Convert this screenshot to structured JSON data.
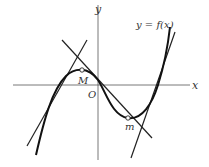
{
  "diagram": {
    "title": "",
    "curve_label": "y = f(x)",
    "axis_labels": {
      "x": "x",
      "y": "y",
      "origin": "O"
    },
    "points": [
      {
        "name": "M",
        "label": "M",
        "kind": "local maximum",
        "px": [
          82,
          70
        ]
      },
      {
        "name": "m",
        "label": "m",
        "kind": "local minimum",
        "px": [
          128,
          118
        ]
      }
    ],
    "lines": [
      {
        "name": "line-left",
        "from": [
          27,
          146
        ],
        "to": [
          87,
          40
        ]
      },
      {
        "name": "line-middle",
        "from": [
          62,
          40
        ],
        "to": [
          152,
          138
        ]
      },
      {
        "name": "line-right",
        "from": [
          131,
          158
        ],
        "to": [
          175,
          32
        ]
      }
    ],
    "colors": {
      "stroke": "#222222",
      "background": "#ffffff"
    }
  }
}
